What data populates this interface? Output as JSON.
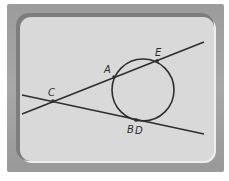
{
  "diagram": {
    "title": "",
    "colors": {
      "frame": "#a0a0a0",
      "panel": "#d9d9d9",
      "stroke": "#2e2e2e"
    },
    "circle": {
      "cx": 143,
      "cy": 90,
      "r": 31
    },
    "lines": [
      {
        "name": "secant-CAE",
        "x1": 22,
        "y1": 114,
        "x2": 204,
        "y2": 42
      },
      {
        "name": "tangent-CD",
        "x1": 22,
        "y1": 95,
        "x2": 204,
        "y2": 134
      }
    ],
    "points": [
      {
        "label": "C",
        "x": 53,
        "y": 101,
        "lx": 48,
        "ly": 96
      },
      {
        "label": "A",
        "x": 114,
        "y": 77,
        "lx": 104,
        "ly": 73
      },
      {
        "label": "E",
        "x": 157,
        "y": 61,
        "lx": 155,
        "ly": 56
      },
      {
        "label": "B",
        "x": 136,
        "y": 120,
        "lx": 127,
        "ly": 133
      },
      {
        "label": "D",
        "x": 136,
        "y": 120,
        "lx": 135,
        "ly": 134
      }
    ]
  }
}
